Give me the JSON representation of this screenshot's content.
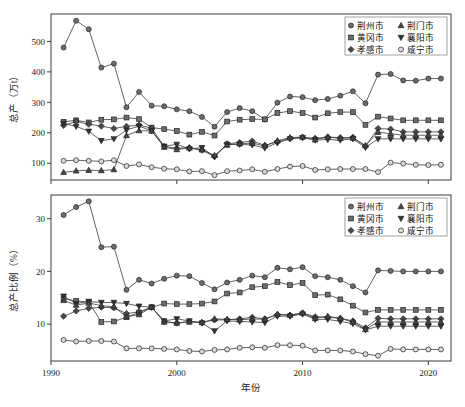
{
  "figure": {
    "width": 465,
    "height": 407,
    "background": "#ffffff",
    "line_color": "#3a3a3a",
    "frame_color": "#3b3b3b"
  },
  "legend": {
    "position": "top-right",
    "entries": [
      {
        "label": "荆州市",
        "marker": "circle",
        "fill": "#6d6d6d"
      },
      {
        "label": "荆门市",
        "marker": "triangle-up",
        "fill": "#454545"
      },
      {
        "label": "黄冈市",
        "marker": "square",
        "fill": "#6d6d6d"
      },
      {
        "label": "襄阳市",
        "marker": "triangle-down",
        "fill": "#333333"
      },
      {
        "label": "孝感市",
        "marker": "diamond",
        "fill": "#4a4a4a"
      },
      {
        "label": "咸宁市",
        "marker": "circle-open",
        "fill": "#d9d9d9"
      }
    ]
  },
  "chart_data": [
    {
      "type": "line",
      "panel": "top",
      "title": "",
      "xlabel": "",
      "ylabel": "总产（万t）",
      "xlim": [
        1990,
        2021.8
      ],
      "ylim": [
        45,
        590
      ],
      "xticks": [
        1990,
        2000,
        2010,
        2020
      ],
      "yticks": [
        100,
        200,
        300,
        400,
        500
      ],
      "grid": false,
      "x": [
        1991,
        1992,
        1993,
        1994,
        1995,
        1996,
        1997,
        1998,
        1999,
        2000,
        2001,
        2002,
        2003,
        2004,
        2005,
        2006,
        2007,
        2008,
        2009,
        2010,
        2011,
        2012,
        2013,
        2014,
        2015,
        2016,
        2017,
        2018,
        2019,
        2020,
        2021
      ],
      "series": [
        {
          "name": "荆州市",
          "marker": "circle",
          "values": [
            480,
            568,
            540,
            414,
            427,
            284,
            334,
            289,
            287,
            277,
            271,
            252,
            220,
            268,
            281,
            271,
            244,
            299,
            319,
            317,
            307,
            311,
            322,
            336,
            297,
            391,
            393,
            372,
            371,
            378,
            378
          ]
        },
        {
          "name": "黄冈市",
          "marker": "square",
          "values": [
            236,
            241,
            234,
            243,
            244,
            250,
            245,
            217,
            212,
            206,
            194,
            203,
            191,
            237,
            243,
            245,
            244,
            265,
            271,
            265,
            250,
            264,
            268,
            268,
            226,
            253,
            247,
            241,
            241,
            241,
            241
          ]
        },
        {
          "name": "孝感市",
          "marker": "diamond",
          "values": [
            224,
            237,
            228,
            222,
            214,
            221,
            225,
            215,
            155,
            149,
            151,
            143,
            122,
            164,
            168,
            173,
            159,
            170,
            182,
            185,
            182,
            186,
            184,
            185,
            156,
            214,
            212,
            203,
            203,
            203,
            203
          ]
        },
        {
          "name": "襄阳市",
          "marker": "triangle-down",
          "values": [
            231,
            221,
            205,
            174,
            180,
            209,
            222,
            206,
            156,
            162,
            147,
            151,
            121,
            162,
            162,
            160,
            150,
            167,
            180,
            184,
            176,
            178,
            176,
            180,
            152,
            180,
            180,
            180,
            180,
            180,
            180
          ]
        },
        {
          "name": "荆门市",
          "marker": "triangle-up",
          "values": [
            70,
            75,
            77,
            76,
            79,
            191,
            207,
            206,
            153,
            145,
            150,
            144,
            126,
            160,
            164,
            166,
            157,
            174,
            184,
            186,
            177,
            186,
            182,
            183,
            158,
            202,
            197,
            192,
            192,
            192,
            192
          ]
        },
        {
          "name": "咸宁市",
          "marker": "circle-open",
          "values": [
            108,
            110,
            108,
            106,
            110,
            91,
            96,
            87,
            82,
            80,
            73,
            74,
            61,
            74,
            76,
            80,
            72,
            81,
            89,
            91,
            78,
            80,
            81,
            81,
            81,
            71,
            102,
            99,
            95,
            94,
            95
          ]
        }
      ]
    },
    {
      "type": "line",
      "panel": "bottom",
      "title": "",
      "xlabel": "年份",
      "ylabel": "总产比例（%）",
      "xlim": [
        1990,
        2021.8
      ],
      "ylim": [
        3.0,
        34.5
      ],
      "xticks": [
        1990,
        2000,
        2010,
        2020
      ],
      "yticks": [
        10,
        20,
        30
      ],
      "grid": false,
      "x": [
        1991,
        1992,
        1993,
        1994,
        1995,
        1996,
        1997,
        1998,
        1999,
        2000,
        2001,
        2002,
        2003,
        2004,
        2005,
        2006,
        2007,
        2008,
        2009,
        2010,
        2011,
        2012,
        2013,
        2014,
        2015,
        2016,
        2017,
        2018,
        2019,
        2020,
        2021
      ],
      "series": [
        {
          "name": "荆州市",
          "marker": "circle",
          "values": [
            30.7,
            32.2,
            33.3,
            24.6,
            24.7,
            16.5,
            18.4,
            17.7,
            18.6,
            19.2,
            19.1,
            17.8,
            16.6,
            17.9,
            18.4,
            19.2,
            18.9,
            20.7,
            20.4,
            20.8,
            19.1,
            18.9,
            18.4,
            17.2,
            16.0,
            20.2,
            20.1,
            20.0,
            20.0,
            20.0,
            20.0
          ]
        },
        {
          "name": "黄冈市",
          "marker": "square",
          "values": [
            14.8,
            14.4,
            14.2,
            10.4,
            10.5,
            11.3,
            12.2,
            13.2,
            13.9,
            13.8,
            13.8,
            13.9,
            14.3,
            15.8,
            16.0,
            17.0,
            17.2,
            18.0,
            17.4,
            17.8,
            15.5,
            15.6,
            14.7,
            13.5,
            12.2,
            12.7,
            12.7,
            12.7,
            12.7,
            12.7,
            12.7
          ]
        },
        {
          "name": "孝感市",
          "marker": "diamond",
          "values": [
            11.5,
            12.5,
            13.0,
            13.2,
            13.1,
            12.0,
            12.3,
            13.2,
            10.5,
            10.2,
            10.5,
            10.3,
            10.8,
            10.8,
            11.0,
            11.3,
            11.0,
            11.8,
            11.7,
            12.1,
            11.4,
            11.3,
            11.1,
            10.6,
            9.3,
            11.1,
            11.0,
            11.0,
            11.0,
            11.0,
            11.0
          ]
        },
        {
          "name": "襄阳市",
          "marker": "triangle-down",
          "values": [
            15.3,
            13.9,
            14.3,
            14.1,
            14.1,
            13.9,
            13.4,
            13.2,
            10.6,
            11.0,
            10.6,
            10.2,
            8.7,
            10.6,
            10.5,
            10.4,
            10.3,
            11.5,
            11.5,
            11.9,
            10.9,
            10.9,
            10.5,
            10.1,
            8.9,
            9.6,
            9.6,
            9.6,
            9.6,
            9.6,
            9.6
          ]
        },
        {
          "name": "荆门市",
          "marker": "triangle-up",
          "values": [
            14.5,
            13.6,
            14.0,
            13.5,
            13.3,
            11.4,
            11.8,
            13.2,
            10.4,
            10.2,
            10.4,
            10.3,
            11.0,
            10.9,
            10.8,
            11.0,
            10.9,
            11.9,
            11.7,
            12.1,
            11.1,
            11.5,
            11.1,
            10.4,
            9.0,
            10.4,
            10.4,
            10.4,
            10.4,
            10.4,
            10.4
          ]
        },
        {
          "name": "咸宁市",
          "marker": "circle-open",
          "values": [
            7.0,
            6.7,
            6.8,
            6.8,
            6.7,
            5.4,
            5.4,
            5.4,
            5.3,
            5.2,
            4.9,
            4.8,
            5.1,
            5.2,
            5.5,
            5.6,
            5.5,
            6.0,
            6.0,
            5.9,
            5.0,
            5.0,
            5.0,
            4.8,
            4.3,
            4.0,
            5.3,
            5.2,
            5.2,
            5.2,
            5.2
          ]
        }
      ]
    }
  ]
}
